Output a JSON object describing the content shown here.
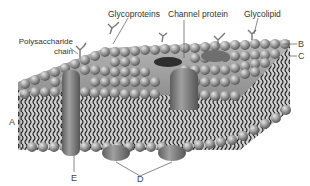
{
  "diagram": {
    "labels": {
      "polysaccharide_line1": "Polysaccharide",
      "polysaccharide_line2": "chain",
      "glycoproteins": "Glycoproteins",
      "channel_protein": "Channel protein",
      "glycolipid": "Glycolipid",
      "letter_a": "A",
      "letter_b": "B",
      "letter_c": "C",
      "letter_d": "D",
      "letter_e": "E"
    },
    "colors": {
      "head": "#8a8a8a",
      "head_highlight": "#d0d0d0",
      "tail": "#222222",
      "protein": "#7a7a7a",
      "leader_line": "#555555",
      "background": "#ffffff",
      "membrane_fill": "#c8c8c8"
    }
  }
}
